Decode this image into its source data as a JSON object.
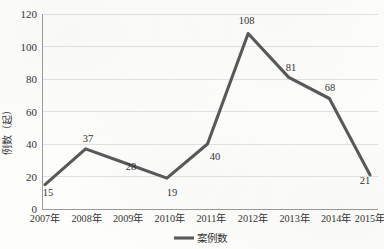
{
  "chart_data": {
    "type": "line",
    "title": "",
    "xlabel": "",
    "ylabel": "例数（起）",
    "categories": [
      "2007年",
      "2008年",
      "2009年",
      "2010年",
      "2011年",
      "2012年",
      "2013年",
      "2014年",
      "2015年"
    ],
    "series": [
      {
        "name": "案例数",
        "values": [
          15,
          37,
          28,
          19,
          40,
          108,
          81,
          68,
          21
        ],
        "color": "#595959"
      }
    ],
    "values": [
      15,
      37,
      28,
      19,
      40,
      108,
      81,
      68,
      21
    ],
    "data_labels": [
      "15",
      "37",
      "28",
      "19",
      "40",
      "108",
      "81",
      "68",
      "21"
    ],
    "ylim": [
      0,
      120
    ],
    "ytick_step": 20,
    "yticks": [
      "0",
      "20",
      "40",
      "60",
      "80",
      "100",
      "120"
    ],
    "grid": true,
    "legend_position": "bottom-center",
    "legend_entries": [
      "案例数"
    ]
  },
  "legend": {
    "label": "案例数",
    "swatch_color": "#595959"
  },
  "axis": {
    "y_title": "例数（起）"
  },
  "colors": {
    "line": "#595959",
    "gridline": "#e2e2e2",
    "axis": "#9a9a9a",
    "text": "#333333",
    "background": "#fdfdfc"
  }
}
